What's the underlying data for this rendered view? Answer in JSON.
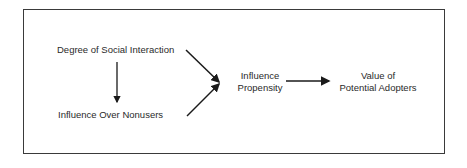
{
  "diagram": {
    "nodes": {
      "social_interaction": "Degree of Social Interaction",
      "influence_nonusers": "Influence Over Nonusers",
      "influence_propensity_line1": "Influence",
      "influence_propensity_line2": "Propensity",
      "value_adopters_line1": "Value of",
      "value_adopters_line2": "Potential Adopters"
    },
    "edges": [
      {
        "from": "Degree of Social Interaction",
        "to": "Influence Over Nonusers"
      },
      {
        "from": "Degree of Social Interaction",
        "to": "Influence Propensity"
      },
      {
        "from": "Influence Over Nonusers",
        "to": "Influence Propensity"
      },
      {
        "from": "Influence Propensity",
        "to": "Value of Potential Adopters"
      }
    ],
    "colors": {
      "line": "#1a1a1a",
      "text": "#2a2a2a",
      "frame": "#3a3a3a"
    }
  }
}
